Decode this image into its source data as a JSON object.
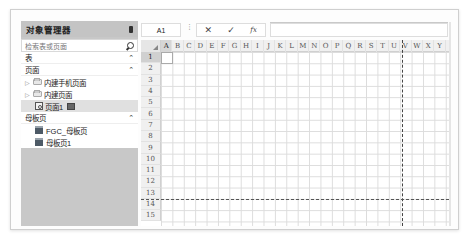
{
  "sidebar": {
    "title": "对象管理器",
    "pin_icon": "pin-icon",
    "search": {
      "placeholder": "检索表或页面",
      "icon": "search-icon"
    },
    "sections": {
      "tables": {
        "label": "表",
        "caret": "^"
      },
      "pages": {
        "label": "页面",
        "caret": "^",
        "items": [
          {
            "label": "内建手机页面",
            "type": "folder",
            "expandable": true
          },
          {
            "label": "内建页面",
            "type": "folder",
            "expandable": true
          },
          {
            "label": "页面1",
            "type": "page",
            "selected": true
          }
        ]
      },
      "masters": {
        "label": "母板页",
        "caret": "^",
        "items": [
          {
            "label": "FGC_母板页",
            "type": "master"
          },
          {
            "label": "母板页1",
            "type": "master"
          }
        ]
      }
    }
  },
  "toolbar": {
    "name_box": "A1",
    "separator": "⋮",
    "cancel": "✕",
    "confirm": "✓",
    "fx": "fx",
    "formula_value": ""
  },
  "grid": {
    "columns": [
      "A",
      "B",
      "C",
      "D",
      "E",
      "F",
      "G",
      "H",
      "I",
      "J",
      "K",
      "L",
      "M",
      "N",
      "O",
      "P",
      "Q",
      "R",
      "S",
      "T",
      "U",
      "V",
      "W",
      "X",
      "Y"
    ],
    "rows": [
      "1",
      "2",
      "3",
      "4",
      "5",
      "6",
      "7",
      "8",
      "9",
      "10",
      "11",
      "12",
      "13",
      "14",
      "15"
    ],
    "active_cell": "A1"
  }
}
